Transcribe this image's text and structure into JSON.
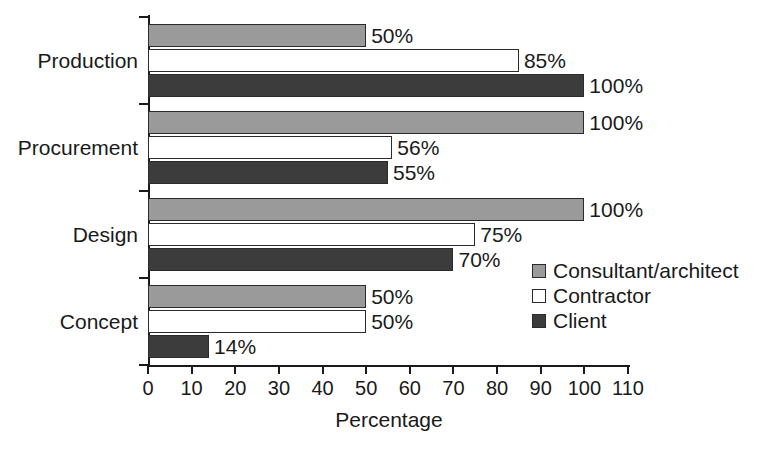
{
  "chart_data": {
    "type": "bar",
    "orientation": "horizontal",
    "title": "",
    "xlabel": "Percentage",
    "ylabel": "",
    "xlim": [
      0,
      110
    ],
    "xticks": [
      0,
      10,
      20,
      30,
      40,
      50,
      60,
      70,
      80,
      90,
      100,
      110
    ],
    "xtick_labels": [
      "0",
      "10",
      "20",
      "30",
      "40",
      "50",
      "60",
      "70",
      "80",
      "90",
      "100",
      "110"
    ],
    "grid": false,
    "legend_position": "middle-right",
    "categories": [
      "Concept",
      "Design",
      "Procurement",
      "Production"
    ],
    "category_order_top_to_bottom": [
      "Production",
      "Procurement",
      "Design",
      "Concept"
    ],
    "series": [
      {
        "name": "Consultant/architect",
        "color": "#9a9a9a",
        "values": [
          50,
          100,
          100,
          50
        ],
        "labels": [
          "50%",
          "100%",
          "100%",
          "50%"
        ]
      },
      {
        "name": "Contractor",
        "color": "#ffffff",
        "values": [
          50,
          75,
          56,
          85
        ],
        "labels": [
          "50%",
          "75%",
          "56%",
          "85%"
        ]
      },
      {
        "name": "Client",
        "color": "#3c3c3c",
        "values": [
          14,
          70,
          55,
          100
        ],
        "labels": [
          "14%",
          "70%",
          "55%",
          "100%"
        ]
      }
    ]
  },
  "legend": {
    "items": [
      {
        "label": "Consultant/architect",
        "color": "#9a9a9a"
      },
      {
        "label": "Contractor",
        "color": "#ffffff"
      },
      {
        "label": "Client",
        "color": "#3c3c3c"
      }
    ]
  },
  "axes": {
    "x_title": "Percentage"
  }
}
